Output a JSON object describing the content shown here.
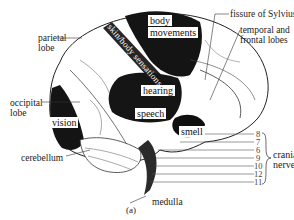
{
  "figure": {
    "caption": "(a)",
    "regions": {
      "body_movements_line1": "body",
      "body_movements_line2": "movements",
      "skin_body_sensations": "skin/body sensations",
      "hearing": "hearing",
      "speech": "speech",
      "smell": "smell",
      "vision": "vision"
    },
    "labels": {
      "parietal_line1": "parietal",
      "parietal_line2": "lobe",
      "occipital_line1": "occipital",
      "occipital_line2": "lobe",
      "cerebellum": "cerebellum",
      "medulla": "medulla",
      "fissure": "fissure of Sylvius",
      "temporal_line1": "temporal and",
      "temporal_line2": "frontal lobes",
      "cranial_line1": "cranial",
      "cranial_line2": "nerves"
    },
    "cranial_nerve_numbers": [
      "8",
      "7",
      "6",
      "9",
      "10",
      "12",
      "11"
    ]
  }
}
